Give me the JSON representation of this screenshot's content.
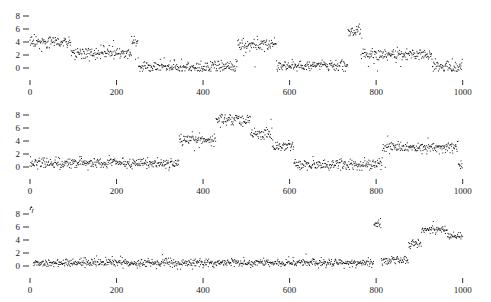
{
  "figure": {
    "title": "",
    "panel_count": 3,
    "background_color": "#ffffff",
    "point_color": "#000000",
    "axis_color": "#1a1a1a"
  },
  "axes": {
    "x_ticks": [
      0,
      200,
      400,
      600,
      800,
      1000
    ],
    "x_tick_labels": [
      "0",
      "200",
      "400",
      "600",
      "800",
      "1000"
    ],
    "y_ticks": [
      0,
      2,
      4,
      6,
      8
    ],
    "y_tick_labels": [
      "0",
      "2",
      "4",
      "6",
      "8"
    ],
    "xlim": [
      0,
      1010
    ],
    "ylim": [
      -0.6,
      9.2
    ],
    "xlabel": "",
    "ylabel": "",
    "grid": false
  },
  "chart_data": {
    "type": "scatter",
    "title": "",
    "subtitle": "",
    "xlabel": "",
    "ylabel": "",
    "xlim": [
      0,
      1010
    ],
    "ylim": [
      -0.6,
      9.2
    ],
    "grid": false,
    "legend": "none",
    "x_ticks": [
      0,
      200,
      400,
      600,
      800,
      1000
    ],
    "y_ticks": [
      0,
      2,
      4,
      6,
      8
    ],
    "panels": [
      {
        "name": "panel-1",
        "index": 0,
        "point_count": 1000,
        "noise_sd": 0.45,
        "segments": [
          {
            "start": 0,
            "end": 95,
            "level": 4.0
          },
          {
            "start": 95,
            "end": 235,
            "level": 2.3
          },
          {
            "start": 235,
            "end": 250,
            "level": 4.0
          },
          {
            "start": 250,
            "end": 480,
            "level": 0.2
          },
          {
            "start": 480,
            "end": 570,
            "level": 3.6
          },
          {
            "start": 570,
            "end": 735,
            "level": 0.3
          },
          {
            "start": 735,
            "end": 765,
            "level": 5.6
          },
          {
            "start": 765,
            "end": 930,
            "level": 2.1
          },
          {
            "start": 930,
            "end": 1000,
            "level": 0.2
          }
        ]
      },
      {
        "name": "panel-2",
        "index": 1,
        "point_count": 1000,
        "noise_sd": 0.42,
        "segments": [
          {
            "start": 0,
            "end": 345,
            "level": 0.6
          },
          {
            "start": 345,
            "end": 430,
            "level": 4.3
          },
          {
            "start": 430,
            "end": 510,
            "level": 7.2
          },
          {
            "start": 510,
            "end": 560,
            "level": 5.0
          },
          {
            "start": 560,
            "end": 610,
            "level": 3.2
          },
          {
            "start": 610,
            "end": 815,
            "level": 0.4
          },
          {
            "start": 815,
            "end": 990,
            "level": 3.0
          },
          {
            "start": 990,
            "end": 1000,
            "level": 0.3
          }
        ]
      },
      {
        "name": "panel-3",
        "index": 2,
        "point_count": 1000,
        "noise_sd": 0.3,
        "segments": [
          {
            "start": 0,
            "end": 8,
            "level": 8.8
          },
          {
            "start": 8,
            "end": 795,
            "level": 0.5
          },
          {
            "start": 795,
            "end": 812,
            "level": 6.5
          },
          {
            "start": 812,
            "end": 875,
            "level": 0.9
          },
          {
            "start": 875,
            "end": 905,
            "level": 3.4
          },
          {
            "start": 905,
            "end": 965,
            "level": 5.6
          },
          {
            "start": 965,
            "end": 1000,
            "level": 4.6
          }
        ]
      }
    ]
  }
}
